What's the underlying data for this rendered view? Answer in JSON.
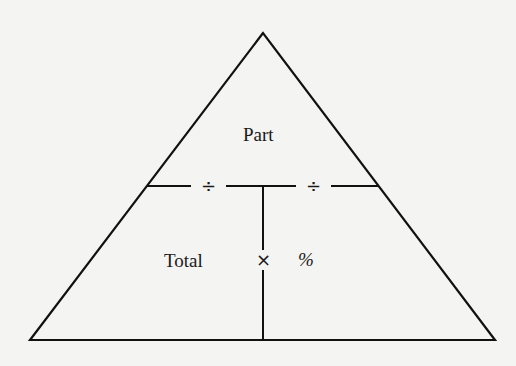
{
  "diagram": {
    "type": "percent-triangle",
    "stroke_color": "#111111",
    "background_color": "#f4f4f2",
    "top_label": "Part",
    "bottom_left_label": "Total",
    "bottom_right_label": "%",
    "left_divider_operator": "÷",
    "right_divider_operator": "÷",
    "center_operator": "×"
  }
}
